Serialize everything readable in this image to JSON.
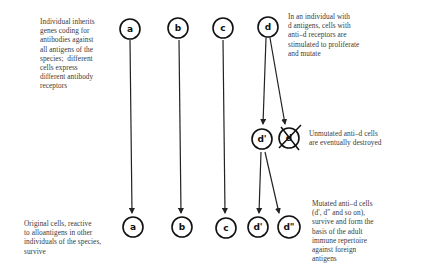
{
  "diagram": {
    "type": "flow",
    "annotations": {
      "top_left": "Individual inherits\ngenes coding for\nantibodies against\nall antigens of the\nspecies;  different\ncells express\ndifferent antibody\nreceptors",
      "top_right": "In an individual with\nd antigens, cells with\nanti–d receptors are\nstimulated to proliferate\nand mutate",
      "middle_right": "Unmutated anti–d cells\nare eventually destroyed",
      "bottom_left": "Original cells, reactive\nto alloantigens in other\nindividuals of the species,\nsurvive",
      "bottom_right": "Mutated anti–d cells\n(d′, d″ and so on),\nsurvive and form the\nbasis of the adult\nimmune repertoire\nagainst foreign\nantigens"
    },
    "nodes": {
      "top_a": "a",
      "top_b": "b",
      "top_c": "c",
      "top_d": "d",
      "mid_d_prime": "d'",
      "mid_d_destroyed": "d",
      "bottom_a": "a",
      "bottom_b": "b",
      "bottom_c": "c",
      "bottom_d_prime": "d'",
      "bottom_d_double_prime": "d\""
    },
    "edges": [
      {
        "from": "top_a",
        "to": "bottom_a"
      },
      {
        "from": "top_b",
        "to": "bottom_b"
      },
      {
        "from": "top_c",
        "to": "bottom_c"
      },
      {
        "from": "top_d",
        "to": "mid_d_prime"
      },
      {
        "from": "top_d",
        "to": "mid_d_destroyed"
      },
      {
        "from": "mid_d_prime",
        "to": "bottom_d_prime"
      },
      {
        "from": "mid_d_prime",
        "to": "bottom_d_double_prime"
      }
    ]
  }
}
